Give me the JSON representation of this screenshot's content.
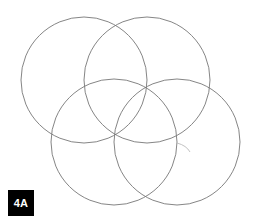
{
  "figure": {
    "label": "4A",
    "background_color": "#ffffff",
    "stroke_color": "#777777",
    "stroke_width": 0.9,
    "badge": {
      "text": "4A",
      "background_color": "#000000",
      "text_color": "#ffffff",
      "x": 8,
      "y": 190,
      "width": 26,
      "height": 26
    },
    "canvas": {
      "width": 257,
      "height": 223
    }
  },
  "chart_data": {
    "type": "diagram",
    "title": "4A",
    "shape": "circle",
    "radius": 63,
    "stroke_color": "#777777",
    "fill": "none",
    "circles": [
      {
        "name": "top-left",
        "cx": 84,
        "cy": 80,
        "r": 63
      },
      {
        "name": "top-right",
        "cx": 147,
        "cy": 80,
        "r": 63
      },
      {
        "name": "bottom-left",
        "cx": 114,
        "cy": 142,
        "r": 63
      },
      {
        "name": "bottom-right",
        "cx": 177,
        "cy": 142,
        "r": 63
      }
    ],
    "intersection_nodes": [
      {
        "name": "top-center",
        "x": 116,
        "y": 14
      },
      {
        "name": "upper-middle",
        "x": 147,
        "y": 81
      },
      {
        "name": "center",
        "x": 115,
        "y": 142
      },
      {
        "name": "right-middle",
        "x": 177,
        "y": 142
      },
      {
        "name": "left-middle",
        "x": 51,
        "y": 142
      },
      {
        "name": "bottom-center",
        "x": 146,
        "y": 205
      }
    ],
    "stray_arc": {
      "name": "faint-tail-arc",
      "start": [
        177,
        143
      ],
      "end": [
        190,
        152
      ],
      "color": "#bbbbbb"
    },
    "grid": false,
    "legend": null,
    "xlabel": "",
    "ylabel": ""
  }
}
